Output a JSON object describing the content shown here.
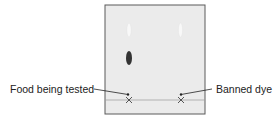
{
  "diagram": {
    "type": "paper-chromatography",
    "colors": {
      "paper": "#ebebeb",
      "paper_border": "#5a5a5a",
      "baseline": "#9a9a9a",
      "dark_spot": "#333333",
      "faint_spot": "#f7f7f7",
      "text": "#222222"
    },
    "labels": {
      "left": "Food being tested",
      "right": "Banned dye"
    },
    "lanes": [
      {
        "name": "food-being-tested",
        "spots": [
          {
            "shade": "faint",
            "cy": 30
          },
          {
            "shade": "dark",
            "cy": 57
          }
        ]
      },
      {
        "name": "banned-dye",
        "spots": [
          {
            "shade": "faint",
            "cy": 30
          }
        ]
      }
    ]
  }
}
